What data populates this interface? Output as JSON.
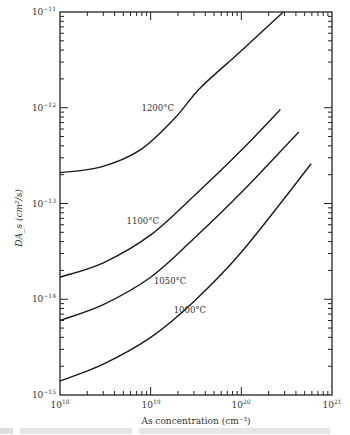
{
  "chart_data": {
    "type": "line",
    "title": "",
    "xlabel": "As concentration (cm⁻³)",
    "ylabel": "DA_s (cm²/s)",
    "xscale": "log",
    "yscale": "log",
    "xlim": [
      1e+18,
      1e+21
    ],
    "ylim": [
      1e-15,
      1e-11
    ],
    "x_ticks": [
      {
        "base": "10",
        "exp": "18",
        "value": 1e+18
      },
      {
        "base": "10",
        "exp": "19",
        "value": 1e+19
      },
      {
        "base": "10",
        "exp": "20",
        "value": 1e+20
      },
      {
        "base": "10",
        "exp": "21",
        "value": 1e+21
      }
    ],
    "y_ticks": [
      {
        "base": "10",
        "exp": "−11",
        "value": 1e-11
      },
      {
        "base": "10",
        "exp": "−12",
        "value": 1e-12
      },
      {
        "base": "10",
        "exp": "−13",
        "value": 1e-13
      },
      {
        "base": "10",
        "exp": "−14",
        "value": 1e-14
      },
      {
        "base": "10",
        "exp": "−15",
        "value": 1e-15
      }
    ],
    "grid": false,
    "legend": "inline labels",
    "series": [
      {
        "name": "1200°C",
        "x": [
          1e+18,
          2.8e+18,
          7.6e+18,
          1.85e+19,
          3.5e+19,
          9.6e+19,
          2.9e+20
        ],
        "y": [
          2.1e-13,
          2.4e-13,
          3.6e-13,
          7.8e-13,
          1.6e-12,
          3.8e-12,
          1e-11
        ],
        "label_pos": [
          1.9e+19,
          1e-12
        ]
      },
      {
        "name": "1100°C",
        "x": [
          1e+18,
          3e+18,
          1e+19,
          3e+19,
          1e+20,
          2.7e+20
        ],
        "y": [
          1.7e-14,
          2.4e-14,
          4.7e-14,
          1.2e-13,
          3.6e-13,
          9.6e-13
        ],
        "label_pos": [
          1.3e+19,
          6.5e-14
        ]
      },
      {
        "name": "1050°C",
        "x": [
          1e+18,
          3e+18,
          1e+19,
          3e+19,
          1e+20,
          4.3e+20
        ],
        "y": [
          6e-15,
          8.8e-15,
          1.7e-14,
          4.3e-14,
          1.3e-13,
          5.6e-13
        ],
        "label_pos": [
          2.6e+19,
          1.55e-14
        ]
      },
      {
        "name": "1000°C",
        "x": [
          1e+18,
          3e+18,
          1e+19,
          3e+19,
          1e+20,
          5.9e+20
        ],
        "y": [
          1.4e-15,
          2.1e-15,
          4e-15,
          9.5e-15,
          3.1e-14,
          2.6e-13
        ],
        "label_pos": [
          4.3e+19,
          7.8e-15
        ]
      }
    ]
  }
}
